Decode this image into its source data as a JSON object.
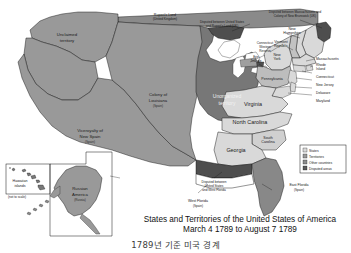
{
  "figure": {
    "title_line1": "States and Territories of the United States of America",
    "title_line2": "March 4 1789 to August 7 1789",
    "caption_korean": "1789년 기준 미국 경계"
  },
  "legend": {
    "items": [
      {
        "label": "States",
        "color": "#d9d9d9"
      },
      {
        "label": "Territories",
        "color": "#9a9a9a"
      },
      {
        "label": "Other countries",
        "color": "#8c8c8c"
      },
      {
        "label": "Disputed areas",
        "color": "#5a5a5a"
      }
    ]
  },
  "regions": {
    "unclaimed": {
      "name": "Unclaimed",
      "name2": "territory"
    },
    "louisiana": {
      "name": "Colony of",
      "name2": "Louisiana",
      "owner": "(Spain)"
    },
    "new_spain": {
      "name": "Viceroyalty of",
      "name2": "New Spain",
      "owner": "(Spain)"
    },
    "unorganized": {
      "name": "Unorganized",
      "name2": "territory"
    },
    "ruperts_land": {
      "name": "Rupert's Land",
      "owner": "(United Kingdom)"
    },
    "russian_america": {
      "name": "Russian",
      "name2": "America",
      "owner": "(Russia)"
    },
    "hawaii": {
      "name": "Hawaiian",
      "name2": "islands",
      "note": "(not to scale)"
    },
    "east_florida": {
      "name": "East Florida",
      "owner": "(Spain)"
    },
    "west_florida": {
      "name": "West Florida",
      "owner": "(Spain)"
    }
  },
  "disputes": {
    "mass_nb": {
      "line1": "Disputed between Massachusetts and",
      "line2": "Colony of New Brunswick (UK)"
    },
    "us_ruperts": {
      "line1": "Disputed between United States",
      "line2": "and Rupert's Land (UK)"
    },
    "us_west_florida": {
      "line1": "Disputed between",
      "line2": "United States",
      "line3": "and West Florida"
    }
  },
  "states": {
    "new_hampshire": {
      "line1": "New",
      "line2": "Hampshire"
    },
    "vermont": {
      "line1": "Vermont",
      "line2": "Republic"
    },
    "new_york": {
      "line1": "New",
      "line2": "York"
    },
    "pennsylvania": {
      "label": "Pennsylvania"
    },
    "virginia": {
      "label": "Virginia"
    },
    "north_carolina": {
      "label": "North Carolina"
    },
    "south_carolina": {
      "line1": "South",
      "line2": "Carolina"
    },
    "georgia": {
      "label": "Georgia"
    },
    "massachusetts": {
      "label": "Massachusetts"
    },
    "rhode_island": {
      "line1": "Rhode",
      "line2": "Island"
    },
    "connecticut": {
      "label": "Connecticut"
    },
    "new_jersey": {
      "label": "New Jersey"
    },
    "delaware": {
      "label": "Delaware"
    },
    "maryland": {
      "label": "Maryland"
    },
    "connecticut_reserve": {
      "line1": "Connecticut",
      "line2": "Western",
      "line3": "Reserve"
    },
    "erie_triangle": {
      "line1": "Erie",
      "line2": "Triangle"
    }
  },
  "colors": {
    "state_fill": "#d9d9d9",
    "territory_fill": "#999999",
    "other_country_fill": "#8a8a8a",
    "disputed_fill": "#555555",
    "border": "#111111",
    "water": "#ffffff",
    "background": "#ffffff"
  }
}
